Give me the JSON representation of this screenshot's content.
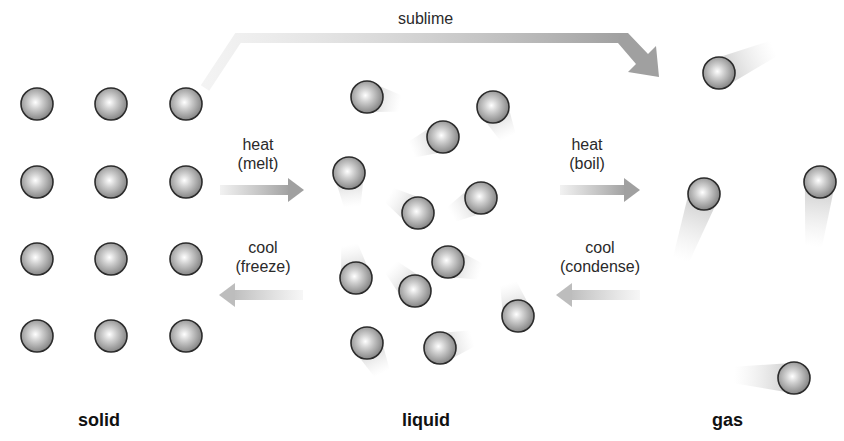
{
  "states": [
    {
      "id": "solid",
      "label": "solid",
      "x": 100
    },
    {
      "id": "liquid",
      "label": "liquid",
      "x": 427
    },
    {
      "id": "gas",
      "label": "gas",
      "x": 729
    }
  ],
  "transitions": {
    "sublime": {
      "label": "sublime"
    },
    "melt": {
      "line1": "heat",
      "line2": "(melt)"
    },
    "freeze": {
      "line1": "cool",
      "line2": "(freeze)"
    },
    "boil": {
      "line1": "heat",
      "line2": "(boil)"
    },
    "condense": {
      "line1": "cool",
      "line2": "(condense)"
    }
  },
  "particles": {
    "radius": 16,
    "solid": [
      [
        37,
        104
      ],
      [
        111,
        104
      ],
      [
        186,
        104
      ],
      [
        37,
        182
      ],
      [
        111,
        182
      ],
      [
        186,
        182
      ],
      [
        37,
        259
      ],
      [
        111,
        259
      ],
      [
        186,
        259
      ],
      [
        37,
        336
      ],
      [
        111,
        336
      ],
      [
        186,
        336
      ]
    ],
    "liquid": [
      {
        "x": 367,
        "y": 97,
        "trail": [
          1,
          0.2
        ]
      },
      {
        "x": 493,
        "y": 107,
        "trail": [
          0.5,
          1
        ]
      },
      {
        "x": 443,
        "y": 137,
        "trail": [
          -1,
          0.4
        ]
      },
      {
        "x": 349,
        "y": 173,
        "trail": [
          0.1,
          1
        ]
      },
      {
        "x": 481,
        "y": 198,
        "trail": [
          -0.9,
          0.5
        ]
      },
      {
        "x": 418,
        "y": 213,
        "trail": [
          -0.8,
          -0.5
        ]
      },
      {
        "x": 448,
        "y": 262,
        "trail": [
          1,
          0.3
        ]
      },
      {
        "x": 356,
        "y": 278,
        "trail": [
          -0.2,
          -1
        ]
      },
      {
        "x": 415,
        "y": 291,
        "trail": [
          -0.7,
          -0.7
        ]
      },
      {
        "x": 518,
        "y": 316,
        "trail": [
          -0.3,
          -1
        ]
      },
      {
        "x": 367,
        "y": 343,
        "trail": [
          0.5,
          1
        ]
      },
      {
        "x": 440,
        "y": 348,
        "trail": [
          1,
          -0.3
        ]
      }
    ],
    "gas": [
      {
        "x": 719,
        "y": 73,
        "trail": [
          1,
          -0.45
        ],
        "len": 60
      },
      {
        "x": 704,
        "y": 194,
        "trail": [
          -0.35,
          1
        ],
        "len": 70
      },
      {
        "x": 820,
        "y": 182,
        "trail": [
          -0.1,
          1
        ],
        "len": 65
      },
      {
        "x": 794,
        "y": 378,
        "trail": [
          -1,
          -0.05
        ],
        "len": 60
      }
    ]
  },
  "colors": {
    "arrow": "#a8a8a8",
    "particle_edge": "#2b2b2b",
    "particle_center": "#ffffff",
    "particle_outer": "#8a8a8a"
  }
}
